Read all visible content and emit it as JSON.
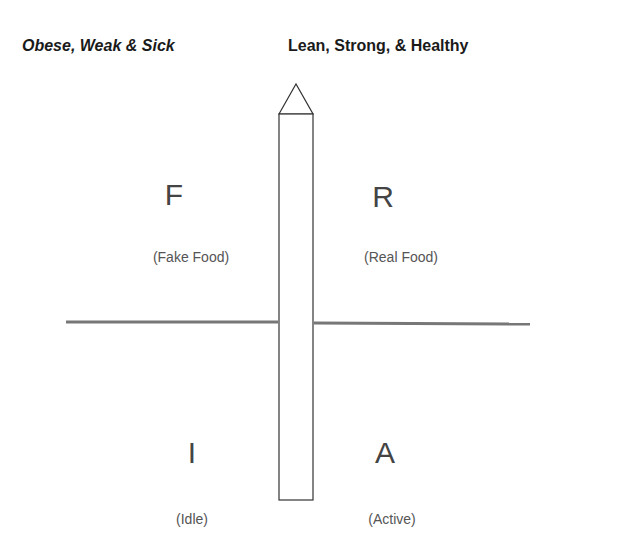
{
  "headers": {
    "left": "Obese, Weak & Sick",
    "right": "Lean, Strong, & Healthy"
  },
  "quadrants": {
    "top_left": {
      "letter": "F",
      "label": "(Fake Food)"
    },
    "top_right": {
      "letter": "R",
      "label": "(Real Food)"
    },
    "bottom_left": {
      "letter": "I",
      "label": "(Idle)"
    },
    "bottom_right": {
      "letter": "A",
      "label": "(Active)"
    }
  },
  "shapes": {
    "pointer": "vertical arrow/pencil shape pointing up",
    "divider": "horizontal line"
  },
  "colors": {
    "stroke": "#333333",
    "divider": "#777777",
    "text": "#444444"
  }
}
